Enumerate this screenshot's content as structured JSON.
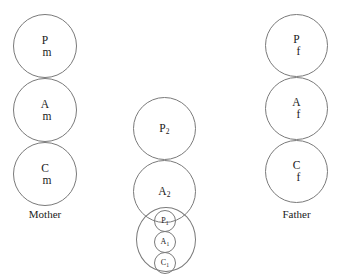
{
  "diagram": {
    "stroke_color": "#7a7a7a",
    "background_color": "#ffffff",
    "columns": [
      {
        "id": "mother",
        "caption": "Mother",
        "states": [
          {
            "id": "parent-mother",
            "line1": "P",
            "line2": "m"
          },
          {
            "id": "adult-mother",
            "line1": "A",
            "line2": "m"
          },
          {
            "id": "child-mother",
            "line1": "C",
            "line2": "m"
          }
        ]
      },
      {
        "id": "child-middle",
        "caption": "",
        "states": [
          {
            "id": "parent-2",
            "base": "P",
            "sub": "2"
          },
          {
            "id": "adult-2",
            "base": "A",
            "sub": "2"
          }
        ],
        "nested_group": {
          "id": "child-1-group",
          "states": [
            {
              "id": "parent-1",
              "base": "P",
              "sub": "1"
            },
            {
              "id": "adult-1",
              "base": "A",
              "sub": "1"
            },
            {
              "id": "child-1",
              "base": "C",
              "sub": "1"
            }
          ]
        }
      },
      {
        "id": "father",
        "caption": "Father",
        "states": [
          {
            "id": "parent-father",
            "line1": "P",
            "line2": "f"
          },
          {
            "id": "adult-father",
            "line1": "A",
            "line2": "f"
          },
          {
            "id": "child-father",
            "line1": "C",
            "line2": "f"
          }
        ]
      }
    ]
  }
}
